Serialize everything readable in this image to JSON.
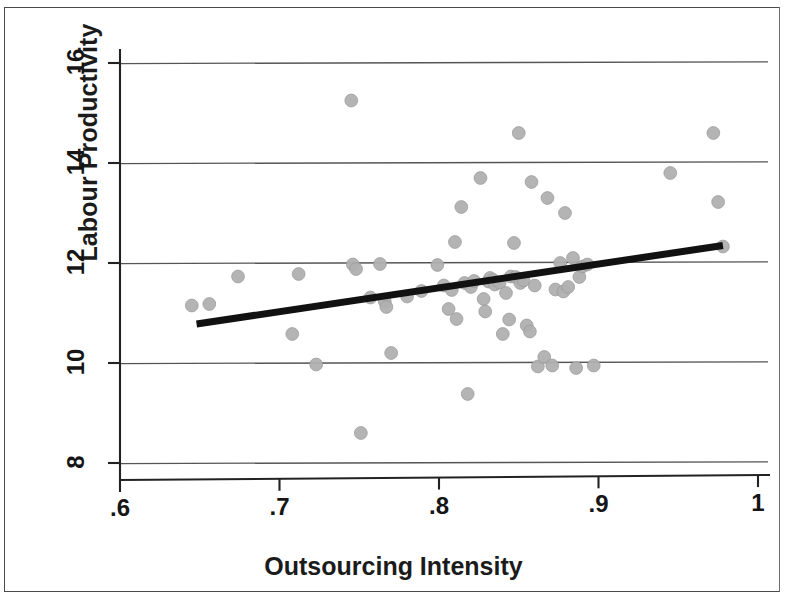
{
  "figure": {
    "background_color": "#ffffff",
    "frame_color": "#4a4a4a",
    "point_color": "#b0b0b0",
    "point_edge_color": "#9a9a9a",
    "line_color": "#111111",
    "grid_color": "#555555"
  },
  "chart_data": {
    "type": "scatter",
    "title": "",
    "subtitle": "",
    "xlabel": "Outsourcing Intensity",
    "ylabel": "Labour Productivity",
    "xlim": [
      0.6,
      1.0
    ],
    "ylim": [
      7.6,
      16.4
    ],
    "xticks": [
      0.6,
      0.7,
      0.8,
      0.9,
      1.0
    ],
    "xticklabels": [
      ".6",
      ".7",
      ".8",
      ".9",
      "1"
    ],
    "yticks": [
      8,
      10,
      12,
      14,
      16
    ],
    "yticklabels": [
      "8",
      "10",
      "12",
      "14",
      "16"
    ],
    "grid": "horizontal",
    "grid_values": [
      8,
      10,
      12,
      14,
      16
    ],
    "legend": null,
    "legend_position": "none",
    "series": [
      {
        "name": "observations",
        "type": "scatter",
        "marker": "circle",
        "color": "#b0b0b0",
        "points": [
          [
            0.645,
            11.15
          ],
          [
            0.656,
            11.18
          ],
          [
            0.674,
            11.73
          ],
          [
            0.708,
            10.58
          ],
          [
            0.712,
            11.78
          ],
          [
            0.723,
            9.97
          ],
          [
            0.745,
            15.25
          ],
          [
            0.746,
            11.97
          ],
          [
            0.748,
            11.88
          ],
          [
            0.751,
            8.6
          ],
          [
            0.757,
            11.31
          ],
          [
            0.763,
            11.98
          ],
          [
            0.766,
            11.23
          ],
          [
            0.767,
            11.12
          ],
          [
            0.77,
            10.2
          ],
          [
            0.78,
            11.33
          ],
          [
            0.789,
            11.44
          ],
          [
            0.799,
            11.96
          ],
          [
            0.803,
            11.55
          ],
          [
            0.806,
            11.08
          ],
          [
            0.808,
            11.46
          ],
          [
            0.81,
            12.42
          ],
          [
            0.811,
            10.88
          ],
          [
            0.814,
            13.12
          ],
          [
            0.816,
            11.6
          ],
          [
            0.818,
            9.38
          ],
          [
            0.82,
            11.52
          ],
          [
            0.822,
            11.64
          ],
          [
            0.826,
            13.7
          ],
          [
            0.828,
            11.28
          ],
          [
            0.829,
            11.03
          ],
          [
            0.831,
            11.63
          ],
          [
            0.832,
            11.7
          ],
          [
            0.834,
            11.66
          ],
          [
            0.835,
            11.57
          ],
          [
            0.838,
            11.61
          ],
          [
            0.84,
            10.58
          ],
          [
            0.842,
            11.4
          ],
          [
            0.844,
            10.87
          ],
          [
            0.845,
            11.73
          ],
          [
            0.847,
            12.4
          ],
          [
            0.848,
            11.72
          ],
          [
            0.85,
            14.6
          ],
          [
            0.851,
            11.6
          ],
          [
            0.853,
            11.65
          ],
          [
            0.855,
            10.75
          ],
          [
            0.857,
            10.63
          ],
          [
            0.858,
            13.62
          ],
          [
            0.86,
            11.55
          ],
          [
            0.862,
            9.93
          ],
          [
            0.866,
            10.12
          ],
          [
            0.868,
            13.3
          ],
          [
            0.871,
            9.95
          ],
          [
            0.873,
            11.47
          ],
          [
            0.876,
            12.0
          ],
          [
            0.878,
            11.43
          ],
          [
            0.879,
            13.0
          ],
          [
            0.881,
            11.52
          ],
          [
            0.884,
            12.1
          ],
          [
            0.886,
            9.9
          ],
          [
            0.888,
            11.72
          ],
          [
            0.89,
            11.93
          ],
          [
            0.893,
            11.97
          ],
          [
            0.897,
            9.95
          ],
          [
            0.945,
            13.8
          ],
          [
            0.972,
            14.6
          ],
          [
            0.975,
            13.22
          ],
          [
            0.978,
            12.33
          ]
        ]
      }
    ],
    "fit_line": {
      "name": "linear fit",
      "color": "#111111",
      "x": [
        0.648,
        0.978
      ],
      "y": [
        10.78,
        12.35
      ],
      "width_px": 7
    }
  }
}
